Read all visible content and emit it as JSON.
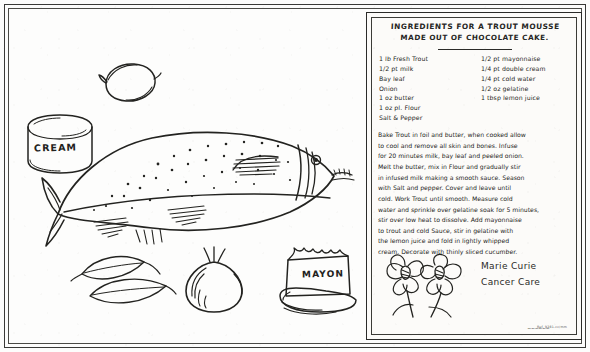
{
  "document": {
    "kind": "handwritten-recipe-card-scan",
    "ink_color": "#232320",
    "paper_color": "#fdfdfc"
  },
  "recipe": {
    "title_line1": "INGREDIENTS FOR A TROUT MOUSSE",
    "title_line2": "MADE OUT OF CHOCOLATE CAKE.",
    "ingredients_left": [
      "1 lb Fresh Trout",
      "1/2 pt milk",
      "Bay leaf",
      "Onion",
      "1 oz butter",
      "1 oz pl. Flour",
      "Salt & Pepper"
    ],
    "ingredients_right": [
      "1/2 pt mayonnaise",
      "1/4 pt double cream",
      "1/4 pt cold water",
      "1/2 oz gelatine",
      "1 tbsp lemon juice"
    ],
    "method_lines": [
      "Bake Trout in foil and butter, when cooked allow",
      "to cool and remove all skin and bones.  Infuse",
      "for 20 minutes milk, bay leaf and peeled onion.",
      "Melt the butter, mix in Flour and gradually stir",
      "in infused milk making a smooth sauce. Season",
      "with Salt and pepper.  Cover and leave until",
      "cold.  Work Trout until smooth. Measure cold",
      "water and sprinkle over gelatine soak for 5 minutes,",
      "stir over low heat to dissolve.  Add mayonnaise",
      "to trout and cold Sauce, stir in gelatine with",
      "the lemon juice and fold in lightly whipped",
      "cream.  Decorate with thinly sliced cucumber."
    ],
    "signature_line1": "Marie Curie",
    "signature_line2": "Cancer Care",
    "footer_scribble": "~~~~~~",
    "serial_mark": "Ref. 9281-cc/mm"
  },
  "illustration": {
    "cream_jar_label": "CREAM",
    "mayonnaise_jar_label": "MAYON",
    "items": [
      {
        "name": "lemon",
        "caption": ""
      },
      {
        "name": "cream-jar",
        "caption": "CREAM"
      },
      {
        "name": "trout-fish",
        "caption": ""
      },
      {
        "name": "bay-leaves",
        "caption": ""
      },
      {
        "name": "onion",
        "caption": ""
      },
      {
        "name": "mayonnaise-jar",
        "caption": "MAYON"
      }
    ]
  }
}
